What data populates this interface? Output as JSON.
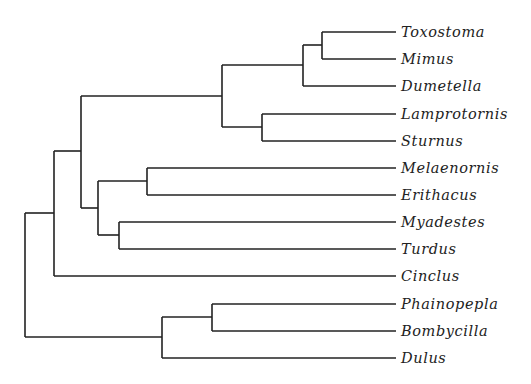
{
  "diagram": {
    "type": "phylogenetic-tree",
    "leaves": [
      {
        "name": "Toxostoma",
        "y": 32
      },
      {
        "name": "Mimus",
        "y": 59
      },
      {
        "name": "Dumetella",
        "y": 86
      },
      {
        "name": "Lamprotornis",
        "y": 114
      },
      {
        "name": "Sturnus",
        "y": 141
      },
      {
        "name": "Melaenornis",
        "y": 168
      },
      {
        "name": "Erithacus",
        "y": 195
      },
      {
        "name": "Myadestes",
        "y": 222
      },
      {
        "name": "Turdus",
        "y": 249
      },
      {
        "name": "Cinclus",
        "y": 276
      },
      {
        "name": "Phainopepla",
        "y": 304
      },
      {
        "name": "Bombycilla",
        "y": 331
      },
      {
        "name": "Dulus",
        "y": 358
      }
    ],
    "newick": "(((((Toxostoma,Mimus),Dumetella),(Lamprotornis,Sturnus)),((Melaenornis,Erithacus),(Myadestes,Turdus))),Cinclus),((Phainopepla,Bombycilla),Dulus));",
    "line_color": "#222222"
  }
}
